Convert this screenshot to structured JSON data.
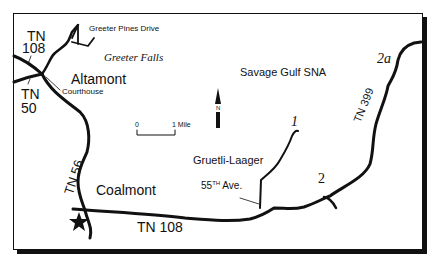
{
  "map": {
    "places": {
      "greeter_pines_drive": "Greeter Pines Drive",
      "greeter_falls": "Greeter Falls",
      "altamont": "Altamont",
      "courthouse": "Courthouse",
      "savage_gulf": "Savage Gulf SNA",
      "gruetli_laager": "Gruetli-Laager",
      "fifty_fifth_ave": "55",
      "fifty_fifth_sup": "TH",
      "fifty_fifth_suffix": " Ave.",
      "coalmont": "Coalmont"
    },
    "roads": {
      "tn108_top_prefix": "TN",
      "tn108_top_num": "108",
      "tn50_prefix": "TN",
      "tn50_num": "50",
      "tn56": "TN   56",
      "tn108_bottom": "TN  108",
      "tn399": "TN  399"
    },
    "trailheads": {
      "one": "1",
      "two": "2",
      "two_a": "2a"
    },
    "scale": {
      "zero": "0",
      "one_mile": "1 Mile"
    },
    "north": "N"
  }
}
